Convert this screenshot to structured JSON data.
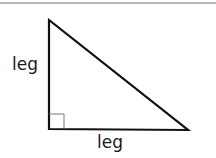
{
  "diagram": {
    "title": "",
    "shape": "right-triangle",
    "labels": {
      "vertical_leg": "leg",
      "horizontal_leg": "leg"
    },
    "vertices": {
      "top": [
        49,
        20
      ],
      "right_angle": [
        49,
        129
      ],
      "bottom_right": [
        188,
        130
      ]
    },
    "right_angle_marker": true,
    "colors": {
      "stroke": "#111111",
      "marker": "#666666",
      "rule": "#b8b8b8"
    }
  }
}
